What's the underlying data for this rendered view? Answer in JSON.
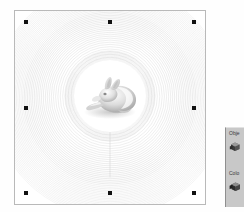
{
  "app": {
    "title": "3D Viewport"
  },
  "viewport": {
    "name": "3d-model-viewport",
    "background_color": "#ffffff",
    "border_color": "#b9b9b9",
    "selected": true,
    "model": {
      "name": "bunny-mesh",
      "description": "shaded 3D organic mesh model",
      "surface_color": "#d8d8d8",
      "highlight_color": "#fcfcfc",
      "shadow_color": "#9a9a9a"
    },
    "field": {
      "name": "concentric-ripple-contours",
      "type": "contour-rings",
      "ring_count": 46,
      "line_color": "#c4c4c4",
      "center_x_pct": 50,
      "center_y_pct": 44,
      "seam_line": true
    },
    "handles": [
      {
        "id": "top-left",
        "label": "resize-handle-top-left"
      },
      {
        "id": "top-center",
        "label": "resize-handle-top-center"
      },
      {
        "id": "top-right",
        "label": "resize-handle-top-right"
      },
      {
        "id": "middle-left",
        "label": "resize-handle-middle-left"
      },
      {
        "id": "middle-right",
        "label": "resize-handle-middle-right"
      },
      {
        "id": "bottom-left",
        "label": "resize-handle-bottom-left"
      },
      {
        "id": "bottom-center",
        "label": "resize-handle-bottom-center"
      },
      {
        "id": "bottom-right",
        "label": "resize-handle-bottom-right"
      }
    ],
    "handle_color": "#111111"
  },
  "tool_panel": {
    "background_color": "#c8c8c8",
    "groups": [
      {
        "label": "Obje",
        "full_label": "Object",
        "icon": "cube-icon",
        "icon_color": "#4a4a4a"
      },
      {
        "label": "Colo",
        "full_label": "Color",
        "icon": "cube-icon",
        "icon_color": "#3c3c3c"
      }
    ]
  }
}
